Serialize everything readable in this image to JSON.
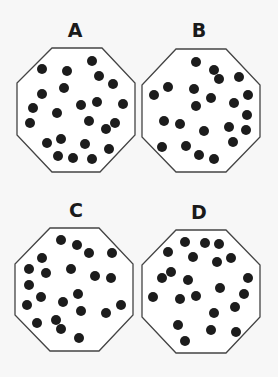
{
  "figure": {
    "panels": [
      {
        "label": "A",
        "label_pos": [
          75,
          37
        ],
        "octagon": [
          [
            52,
            48
          ],
          [
            102,
            48
          ],
          [
            135,
            83
          ],
          [
            135,
            135
          ],
          [
            100,
            172
          ],
          [
            52,
            172
          ],
          [
            17,
            135
          ],
          [
            17,
            83
          ]
        ],
        "dots": [
          [
            92,
            61
          ],
          [
            42,
            69
          ],
          [
            67,
            71
          ],
          [
            99,
            76
          ],
          [
            113,
            84
          ],
          [
            64,
            88
          ],
          [
            42,
            94
          ],
          [
            33,
            108
          ],
          [
            57,
            113
          ],
          [
            81,
            105
          ],
          [
            97,
            102
          ],
          [
            123,
            104
          ],
          [
            30,
            123
          ],
          [
            89,
            121
          ],
          [
            106,
            129
          ],
          [
            115,
            123
          ],
          [
            47,
            143
          ],
          [
            61,
            139
          ],
          [
            85,
            144
          ],
          [
            109,
            149
          ],
          [
            58,
            156
          ],
          [
            73,
            158
          ],
          [
            92,
            159
          ]
        ]
      },
      {
        "label": "B",
        "label_pos": [
          199,
          37
        ],
        "octagon": [
          [
            176,
            49
          ],
          [
            226,
            49
          ],
          [
            260,
            85
          ],
          [
            260,
            137
          ],
          [
            226,
            172
          ],
          [
            176,
            172
          ],
          [
            142,
            137
          ],
          [
            142,
            85
          ]
        ],
        "dots": [
          [
            196,
            62
          ],
          [
            214,
            70
          ],
          [
            219,
            79
          ],
          [
            239,
            77
          ],
          [
            168,
            87
          ],
          [
            154,
            95
          ],
          [
            194,
            89
          ],
          [
            211,
            98
          ],
          [
            248,
            95
          ],
          [
            196,
            106
          ],
          [
            234,
            103
          ],
          [
            164,
            121
          ],
          [
            180,
            124
          ],
          [
            247,
            115
          ],
          [
            204,
            131
          ],
          [
            229,
            127
          ],
          [
            246,
            130
          ],
          [
            162,
            147
          ],
          [
            186,
            146
          ],
          [
            233,
            142
          ],
          [
            199,
            155
          ],
          [
            214,
            159
          ]
        ]
      },
      {
        "label": "C",
        "label_pos": [
          76,
          217
        ],
        "octagon": [
          [
            50,
            228
          ],
          [
            99,
            228
          ],
          [
            133,
            264
          ],
          [
            133,
            315
          ],
          [
            99,
            351
          ],
          [
            50,
            351
          ],
          [
            15,
            315
          ],
          [
            15,
            264
          ]
        ],
        "dots": [
          [
            61,
            240
          ],
          [
            77,
            245
          ],
          [
            89,
            253
          ],
          [
            112,
            253
          ],
          [
            42,
            258
          ],
          [
            29,
            269
          ],
          [
            46,
            273
          ],
          [
            71,
            269
          ],
          [
            95,
            276
          ],
          [
            111,
            278
          ],
          [
            29,
            285
          ],
          [
            41,
            297
          ],
          [
            78,
            294
          ],
          [
            63,
            302
          ],
          [
            27,
            305
          ],
          [
            81,
            311
          ],
          [
            106,
            313
          ],
          [
            121,
            305
          ],
          [
            37,
            323
          ],
          [
            56,
            320
          ],
          [
            61,
            329
          ],
          [
            79,
            338
          ]
        ]
      },
      {
        "label": "D",
        "label_pos": [
          199,
          219
        ],
        "octagon": [
          [
            176,
            230
          ],
          [
            226,
            230
          ],
          [
            260,
            265
          ],
          [
            260,
            317
          ],
          [
            226,
            353
          ],
          [
            176,
            353
          ],
          [
            142,
            317
          ],
          [
            142,
            265
          ]
        ],
        "dots": [
          [
            185,
            242
          ],
          [
            205,
            243
          ],
          [
            219,
            244
          ],
          [
            168,
            252
          ],
          [
            193,
            257
          ],
          [
            217,
            262
          ],
          [
            231,
            258
          ],
          [
            171,
            272
          ],
          [
            162,
            278
          ],
          [
            188,
            280
          ],
          [
            248,
            278
          ],
          [
            220,
            288
          ],
          [
            153,
            297
          ],
          [
            180,
            299
          ],
          [
            196,
            296
          ],
          [
            244,
            294
          ],
          [
            235,
            307
          ],
          [
            214,
            313
          ],
          [
            178,
            325
          ],
          [
            211,
            330
          ],
          [
            236,
            332
          ],
          [
            185,
            341
          ]
        ]
      }
    ],
    "dot_radius": 5,
    "colors": {
      "background": "#f7f7f7",
      "octagon_fill": "#ffffff",
      "octagon_stroke": "#444444",
      "dot": "#1c1c1c",
      "label": "#1a1a1a"
    }
  }
}
